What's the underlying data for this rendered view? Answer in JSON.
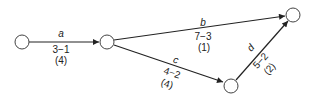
{
  "diagram": {
    "type": "activity-network",
    "nodes": [
      {
        "id": "n1",
        "cx": 22,
        "cy": 42
      },
      {
        "id": "n2",
        "cx": 107,
        "cy": 42
      },
      {
        "id": "n3",
        "cx": 293,
        "cy": 15
      },
      {
        "id": "n4",
        "cx": 231,
        "cy": 86
      }
    ],
    "edges": [
      {
        "id": "a",
        "from": "n1",
        "to": "n2",
        "name": "a",
        "duration": "3−1",
        "slack": "(4)"
      },
      {
        "id": "b",
        "from": "n2",
        "to": "n3",
        "name": "b",
        "duration": "7−3",
        "slack": "(1)"
      },
      {
        "id": "c",
        "from": "n2",
        "to": "n4",
        "name": "c",
        "duration": "4−2",
        "slack": "(4)"
      },
      {
        "id": "d",
        "from": "n4",
        "to": "n3",
        "name": "d",
        "duration": "5−2",
        "slack": "(2)"
      }
    ]
  }
}
